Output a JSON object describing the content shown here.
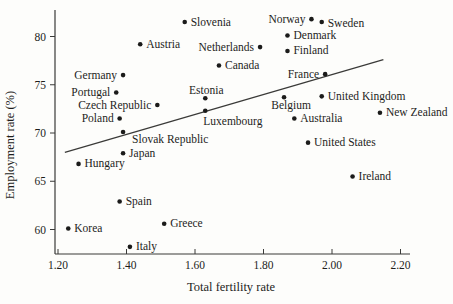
{
  "colors": {
    "background": "#fdfdfb",
    "ink": "#1d1d1b",
    "axis": "#3a3a38",
    "trend_line": "#3a3a38",
    "point": "#1b1b1a"
  },
  "chart_data": {
    "type": "scatter",
    "title": "",
    "xlabel": "Total fertility rate",
    "ylabel": "Employment rate (%)",
    "xlim": [
      1.2,
      2.2
    ],
    "ylim": [
      60,
      80
    ],
    "x_tick_labels": [
      "1.20",
      "1.40",
      "1.60",
      "1.80",
      "2.00",
      "2.20"
    ],
    "y_tick_labels": [
      "60",
      "65",
      "70",
      "75",
      "80"
    ],
    "grid": false,
    "legend": "none",
    "trend_line": {
      "x1": 1.22,
      "y1": 68.0,
      "x2": 2.15,
      "y2": 77.6
    },
    "points": [
      {
        "label": "Korea",
        "x": 1.23,
        "y": 60.1,
        "side": "right"
      },
      {
        "label": "Italy",
        "x": 1.41,
        "y": 58.2,
        "side": "right"
      },
      {
        "label": "Spain",
        "x": 1.38,
        "y": 62.9,
        "side": "right"
      },
      {
        "label": "Greece",
        "x": 1.51,
        "y": 60.6,
        "side": "right"
      },
      {
        "label": "Hungary",
        "x": 1.26,
        "y": 66.8,
        "side": "right"
      },
      {
        "label": "Japan",
        "x": 1.39,
        "y": 67.9,
        "side": "right"
      },
      {
        "label": "Slovak Republic",
        "x": 1.39,
        "y": 70.1,
        "side": "right",
        "dx": 3,
        "dy": 7
      },
      {
        "label": "Poland",
        "x": 1.38,
        "y": 71.5,
        "side": "left"
      },
      {
        "label": "Czech Republic",
        "x": 1.49,
        "y": 72.9,
        "side": "left"
      },
      {
        "label": "Portugal",
        "x": 1.37,
        "y": 74.2,
        "side": "left"
      },
      {
        "label": "Germany",
        "x": 1.39,
        "y": 76.0,
        "side": "left"
      },
      {
        "label": "Austria",
        "x": 1.44,
        "y": 79.2,
        "side": "right"
      },
      {
        "label": "Slovenia",
        "x": 1.57,
        "y": 81.5,
        "side": "right"
      },
      {
        "label": "Estonia",
        "x": 1.63,
        "y": 73.6,
        "side": "above",
        "dx": 1,
        "dy": 2
      },
      {
        "label": "Luxembourg",
        "x": 1.63,
        "y": 72.3,
        "side": "right",
        "dx": -8,
        "dy": 11
      },
      {
        "label": "Canada",
        "x": 1.67,
        "y": 77.0,
        "side": "right"
      },
      {
        "label": "Netherlands",
        "x": 1.79,
        "y": 78.9,
        "side": "left"
      },
      {
        "label": "Finland",
        "x": 1.87,
        "y": 78.5,
        "side": "right"
      },
      {
        "label": "Denmark",
        "x": 1.87,
        "y": 80.1,
        "side": "right"
      },
      {
        "label": "Belgium",
        "x": 1.86,
        "y": 73.7,
        "side": "below",
        "dx": 7,
        "dy": -1
      },
      {
        "label": "Australia",
        "x": 1.89,
        "y": 71.5,
        "side": "right"
      },
      {
        "label": "United States",
        "x": 1.93,
        "y": 69.0,
        "side": "right"
      },
      {
        "label": "Norway",
        "x": 1.94,
        "y": 81.8,
        "side": "left"
      },
      {
        "label": "Sweden",
        "x": 1.97,
        "y": 81.5,
        "side": "right",
        "dy": 1
      },
      {
        "label": "France",
        "x": 1.98,
        "y": 76.1,
        "side": "left"
      },
      {
        "label": "United Kingdom",
        "x": 1.97,
        "y": 73.8,
        "side": "right"
      },
      {
        "label": "New Zealand",
        "x": 2.14,
        "y": 72.1,
        "side": "right"
      },
      {
        "label": "Ireland",
        "x": 2.06,
        "y": 65.5,
        "side": "right"
      }
    ]
  }
}
